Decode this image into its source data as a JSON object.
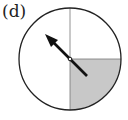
{
  "figure": {
    "label": "(d)",
    "spinner": {
      "sections": 4,
      "shaded_section": "bottom-right",
      "shaded_color": "#c8c8c8",
      "arrow_direction": "up-left"
    }
  }
}
